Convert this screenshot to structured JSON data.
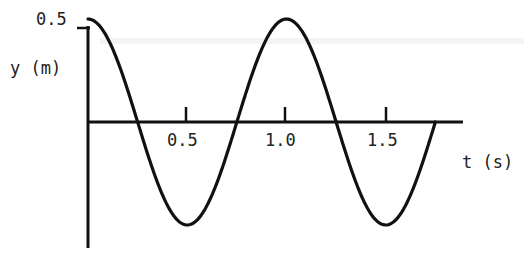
{
  "chart_data": {
    "type": "line",
    "title": "",
    "xlabel": "t (s)",
    "ylabel": "y (m)",
    "x_ticks": [
      0.5,
      1.0,
      1.5
    ],
    "x_tick_labels": [
      "0.5",
      "1.0",
      "1.5"
    ],
    "y_ticks": [
      0.5
    ],
    "y_tick_labels": [
      "0.5"
    ],
    "xlim": [
      0,
      1.8
    ],
    "ylim": [
      -0.55,
      0.55
    ],
    "grid": false,
    "legend": null,
    "series": [
      {
        "name": "y(t)",
        "function": "y = 0.5 cos(2πt)",
        "amplitude": 0.5,
        "period": 1.0,
        "x": [
          0,
          0.125,
          0.25,
          0.375,
          0.5,
          0.625,
          0.75,
          0.875,
          1.0,
          1.125,
          1.25,
          1.375,
          1.5,
          1.625,
          1.75
        ],
        "values": [
          0.5,
          0.354,
          0,
          -0.354,
          -0.5,
          -0.354,
          0,
          0.354,
          0.5,
          0.354,
          0,
          -0.354,
          -0.5,
          -0.354,
          0
        ]
      }
    ]
  },
  "labels": {
    "y_axis": "y (m)",
    "x_axis": "t (s)",
    "y_tick": "0.5",
    "x_tick_0": "0.5",
    "x_tick_1": "1.0",
    "x_tick_2": "1.5"
  },
  "colors": {
    "ink": "#111111",
    "background": "#ffffff"
  }
}
